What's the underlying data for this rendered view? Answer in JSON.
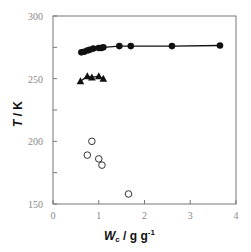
{
  "chart_data": {
    "type": "scatter",
    "title": "",
    "xlabel": "Wc / g g-1",
    "xlabel_main": "W",
    "xlabel_sub": "c",
    "xlabel_unit": " / g g",
    "xlabel_exp": "-1",
    "ylabel": "T / K",
    "ylabel_main": "T",
    "ylabel_unit": " / K",
    "xlim": [
      0,
      4
    ],
    "ylim": [
      150,
      300
    ],
    "x_ticks": [
      0,
      1,
      2,
      3,
      4
    ],
    "y_ticks": [
      150,
      200,
      250,
      300
    ],
    "grid": false,
    "legend": null,
    "series": [
      {
        "name": "filled-circles",
        "marker": "filled-circle",
        "line": true,
        "points": [
          [
            0.62,
            271
          ],
          [
            0.68,
            271.5
          ],
          [
            0.75,
            272.5
          ],
          [
            0.8,
            273
          ],
          [
            0.88,
            274
          ],
          [
            1.0,
            274.5
          ],
          [
            1.05,
            274.5
          ],
          [
            1.1,
            275
          ],
          [
            1.45,
            276
          ],
          [
            1.7,
            276
          ],
          [
            2.6,
            276
          ],
          [
            3.65,
            276.5
          ]
        ]
      },
      {
        "name": "filled-triangles",
        "marker": "filled-triangle",
        "line": true,
        "points": [
          [
            0.6,
            248
          ],
          [
            0.75,
            252
          ],
          [
            0.85,
            251
          ],
          [
            1.0,
            252
          ],
          [
            1.1,
            250
          ]
        ]
      },
      {
        "name": "open-circles",
        "marker": "open-circle",
        "line": false,
        "points": [
          [
            0.75,
            189
          ],
          [
            0.85,
            200
          ],
          [
            1.0,
            186
          ],
          [
            1.07,
            181
          ],
          [
            1.65,
            158
          ]
        ]
      }
    ]
  }
}
